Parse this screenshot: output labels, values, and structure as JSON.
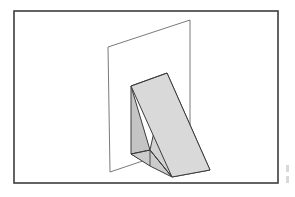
{
  "figure": {
    "caption": "",
    "background_color": "#ffffff",
    "frame": {
      "label": "figure-border",
      "color": "#3d3d3d",
      "stroke_width": 1.6,
      "x": 14,
      "y": 11,
      "width": 264,
      "height": 172
    },
    "plane": {
      "label": "vertical-plane",
      "fill": "#ffffff",
      "stroke": "#6b6b6b",
      "points": "108,47 190,20 190,145 110,172"
    },
    "prism": {
      "label": "triangular-prism-wedge",
      "faces": [
        {
          "name": "top-slanted-face",
          "fill": "#d9d9d9",
          "stroke": "#3c3c3c",
          "points": "131,86 167,73 210,170 172,177"
        },
        {
          "name": "left-vertical-face",
          "fill": "#c4c4c4",
          "stroke": "#3c3c3c",
          "points": "131,86 131,154 150,165 150,150"
        },
        {
          "name": "bottom-base-face",
          "fill": "#cccccc",
          "stroke": "#3c3c3c",
          "points": "131,154 150,150 172,177 150,166"
        },
        {
          "name": "right-front-triangle",
          "fill": "#d2d2d2",
          "stroke": "#3c3c3c",
          "points": "167,73 210,170 172,177 150,150"
        }
      ],
      "interior_edges": [
        {
          "name": "ridge-edge",
          "points": "131,86 167,73"
        },
        {
          "name": "vertical-back-edge",
          "points": "150,150 150,166"
        },
        {
          "name": "hypotenuse-edge",
          "points": "150,150 172,177"
        },
        {
          "name": "inner-diagonal-edge",
          "points": "131,154 150,150"
        }
      ]
    },
    "scan_marks": {
      "label": "scan-edge-artifacts",
      "color": "#b9b9b9",
      "marks": [
        {
          "x": 286,
          "y": 165,
          "width": 3,
          "height": 7
        },
        {
          "x": 286,
          "y": 176,
          "width": 3,
          "height": 7
        }
      ]
    }
  },
  "chart_data": {
    "type": "diagram",
    "objects": [
      {
        "name": "vertical plane",
        "shape": "quadrilateral",
        "vertices": [
          [
            108,
            47
          ],
          [
            190,
            20
          ],
          [
            190,
            145
          ],
          [
            110,
            172
          ]
        ],
        "fill": "white",
        "stroke": "#6b6b6b"
      },
      {
        "name": "triangular prism",
        "shape": "wedge",
        "vertices": [
          [
            131,
            86
          ],
          [
            167,
            73
          ],
          [
            210,
            170
          ],
          [
            172,
            177
          ],
          [
            150,
            150
          ],
          [
            131,
            154
          ],
          [
            150,
            166
          ]
        ],
        "fill": "gray",
        "stroke": "#3c3c3c"
      },
      {
        "name": "border frame",
        "shape": "rectangle",
        "vertices": [
          [
            14,
            11
          ],
          [
            278,
            11
          ],
          [
            278,
            183
          ],
          [
            14,
            183
          ]
        ],
        "fill": "none",
        "stroke": "#3d3d3d"
      }
    ],
    "grid": false,
    "legend": null,
    "xlabel": "",
    "ylabel": ""
  }
}
